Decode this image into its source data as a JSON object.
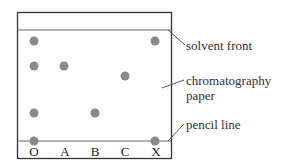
{
  "diagram": {
    "labels": {
      "solvent_front": "solvent front",
      "paper_line1": "chromatography",
      "paper_line2": "paper",
      "pencil_line": "pencil line"
    },
    "columns": [
      "O",
      "A",
      "B",
      "C",
      "X"
    ],
    "spots": [
      {
        "column": "O",
        "positions": [
          "top",
          "upper",
          "lower",
          "baseline"
        ]
      },
      {
        "column": "A",
        "positions": [
          "upper"
        ]
      },
      {
        "column": "B",
        "positions": [
          "lower"
        ]
      },
      {
        "column": "C",
        "positions": [
          "middle"
        ]
      },
      {
        "column": "X",
        "positions": [
          "top",
          "baseline"
        ]
      }
    ],
    "colors": {
      "spot": "#8a8a8a",
      "line": "#555555",
      "border": "#333333"
    }
  }
}
